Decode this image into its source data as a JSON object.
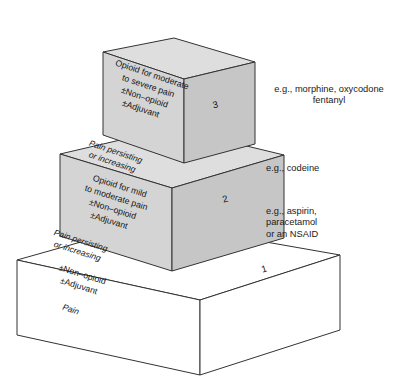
{
  "diagram": {
    "type": "three-step-ladder",
    "steps": [
      {
        "number": "1",
        "front_text": "±Non–opioid\n±Adjuvant",
        "riser_text": "Pain",
        "side_label": "e.g., aspirin,\nparacetamol\nor an NSAID",
        "fill": "#ffffff"
      },
      {
        "number": "2",
        "front_text": "Opioid for mild\nto moderate pain\n±Non–opioid\n±Adjuvant",
        "riser_text": "Pain persisting\nor increasing",
        "side_label": "e.g., codeine",
        "fill": "#d6d6d6"
      },
      {
        "number": "3",
        "front_text": "Opioid for moderate\nto severe pain\n±Non–opioid\n±Adjuvant",
        "riser_text": "Pain persisting\nor increasing",
        "side_label": "e.g., morphine, oxycodone\nfentanyl",
        "fill": "#d6d6d6"
      }
    ],
    "colors": {
      "outline": "#333333",
      "front_face": "#d4d4d4",
      "side_face": "#c6c6c6",
      "top_face": "#dedede",
      "base_face": "#ffffff",
      "text": "#141414"
    }
  }
}
